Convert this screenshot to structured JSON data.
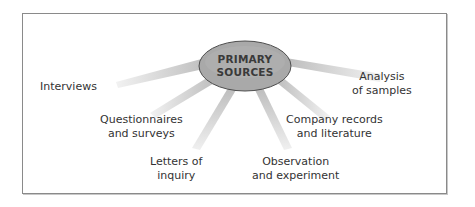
{
  "diagram": {
    "hub": {
      "label": "PRIMARY\nSOURCES",
      "fill": "#a9a9a9",
      "stroke": "#555555"
    },
    "ray_color": "#d2d2d2",
    "sources": [
      {
        "id": "interviews",
        "label": "Interviews"
      },
      {
        "id": "questionnaires",
        "label": "Questionnaires\nand surveys"
      },
      {
        "id": "letters",
        "label": "Letters of\ninquiry"
      },
      {
        "id": "observation",
        "label": "Observation\nand experiment"
      },
      {
        "id": "company-records",
        "label": "Company records\nand literature"
      },
      {
        "id": "analysis",
        "label": "Analysis\nof samples"
      }
    ]
  }
}
